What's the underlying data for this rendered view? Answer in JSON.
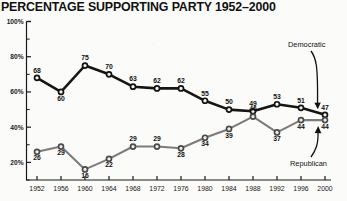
{
  "chart_data": {
    "type": "line",
    "title": "PERCENTAGE SUPPORTING PARTY 1952–2000",
    "xlabel": "",
    "ylabel": "",
    "categories": [
      "1952",
      "1956",
      "1960",
      "1964",
      "1968",
      "1972",
      "1976",
      "1980",
      "1984",
      "1988",
      "1992",
      "1996",
      "2000"
    ],
    "ylim": [
      10,
      100
    ],
    "ytick_labels": [
      "100%",
      "80%",
      "60%",
      "40%",
      "20%"
    ],
    "ytick_values": [
      100,
      80,
      60,
      40,
      20
    ],
    "yminor_values": [
      90,
      70,
      50,
      30,
      10
    ],
    "grid": false,
    "legend_position": "inline-annotations",
    "series": [
      {
        "name": "Democratic",
        "color": "#151515",
        "values": [
          68,
          60,
          75,
          70,
          63,
          62,
          62,
          55,
          50,
          49,
          53,
          51,
          47
        ]
      },
      {
        "name": "Republican",
        "color": "#7c7c7c",
        "values": [
          26,
          29,
          16,
          22,
          29,
          29,
          28,
          34,
          39,
          46,
          37,
          44,
          44
        ]
      }
    ],
    "annotations": [
      {
        "text": "Democratic",
        "target_series": "Democratic",
        "target_year": "2000"
      },
      {
        "text": "Republican",
        "target_series": "Republican",
        "target_year": "2000"
      }
    ]
  }
}
